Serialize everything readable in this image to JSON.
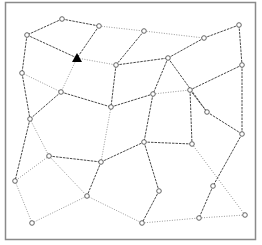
{
  "diagram": {
    "type": "graph",
    "frame": {
      "x": 5,
      "y": 2,
      "width": 250,
      "height": 237,
      "stroke": "#8a8a8a",
      "fill": "#ffffff"
    },
    "colors": {
      "dashed_edge": "#4a4a4a",
      "dotted_edge": "#9a9a9a",
      "node_fill": "#ffffff",
      "node_stroke": "#555555",
      "marker": "#000000"
    },
    "marker": {
      "type": "triangle",
      "x": 77,
      "y": 58
    },
    "nodes": [
      {
        "id": "n1",
        "x": 62,
        "y": 19
      },
      {
        "id": "n2",
        "x": 27,
        "y": 35
      },
      {
        "id": "n3",
        "x": 99,
        "y": 26
      },
      {
        "id": "n4",
        "x": 144,
        "y": 31
      },
      {
        "id": "n5",
        "x": 204,
        "y": 38
      },
      {
        "id": "n6",
        "x": 239,
        "y": 25
      },
      {
        "id": "n7",
        "x": 116,
        "y": 65
      },
      {
        "id": "n8",
        "x": 168,
        "y": 58
      },
      {
        "id": "n9",
        "x": 242,
        "y": 65
      },
      {
        "id": "n10",
        "x": 22,
        "y": 73
      },
      {
        "id": "n11",
        "x": 61,
        "y": 92
      },
      {
        "id": "n12",
        "x": 111,
        "y": 107
      },
      {
        "id": "n13",
        "x": 153,
        "y": 94
      },
      {
        "id": "n14",
        "x": 190,
        "y": 90
      },
      {
        "id": "n15",
        "x": 207,
        "y": 112
      },
      {
        "id": "n16",
        "x": 30,
        "y": 119
      },
      {
        "id": "n17",
        "x": 242,
        "y": 134
      },
      {
        "id": "n18",
        "x": 49,
        "y": 156
      },
      {
        "id": "n19",
        "x": 101,
        "y": 162
      },
      {
        "id": "n20",
        "x": 144,
        "y": 142
      },
      {
        "id": "n21",
        "x": 192,
        "y": 144
      },
      {
        "id": "n22",
        "x": 15,
        "y": 181
      },
      {
        "id": "n23",
        "x": 87,
        "y": 196
      },
      {
        "id": "n24",
        "x": 159,
        "y": 191
      },
      {
        "id": "n25",
        "x": 213,
        "y": 186
      },
      {
        "id": "n26",
        "x": 32,
        "y": 223
      },
      {
        "id": "n27",
        "x": 142,
        "y": 223
      },
      {
        "id": "n28",
        "x": 199,
        "y": 218
      },
      {
        "id": "n29",
        "x": 245,
        "y": 215
      }
    ],
    "edges": [
      {
        "from": [
          62,
          19
        ],
        "to": [
          27,
          35
        ],
        "style": "dashed"
      },
      {
        "from": [
          62,
          19
        ],
        "to": [
          99,
          26
        ],
        "style": "dashed"
      },
      {
        "from": [
          27,
          35
        ],
        "to": [
          77,
          58
        ],
        "style": "dashed"
      },
      {
        "from": [
          99,
          26
        ],
        "to": [
          77,
          58
        ],
        "style": "dashed"
      },
      {
        "from": [
          99,
          26
        ],
        "to": [
          144,
          31
        ],
        "style": "dotted"
      },
      {
        "from": [
          144,
          31
        ],
        "to": [
          204,
          38
        ],
        "style": "dotted"
      },
      {
        "from": [
          144,
          31
        ],
        "to": [
          116,
          65
        ],
        "style": "dashed"
      },
      {
        "from": [
          204,
          38
        ],
        "to": [
          239,
          25
        ],
        "style": "dashed"
      },
      {
        "from": [
          204,
          38
        ],
        "to": [
          168,
          58
        ],
        "style": "dashed"
      },
      {
        "from": [
          239,
          25
        ],
        "to": [
          242,
          65
        ],
        "style": "dashed"
      },
      {
        "from": [
          77,
          58
        ],
        "to": [
          116,
          65
        ],
        "style": "dotted"
      },
      {
        "from": [
          77,
          58
        ],
        "to": [
          61,
          92
        ],
        "style": "dotted"
      },
      {
        "from": [
          27,
          35
        ],
        "to": [
          22,
          73
        ],
        "style": "dashed"
      },
      {
        "from": [
          116,
          65
        ],
        "to": [
          168,
          58
        ],
        "style": "dashed"
      },
      {
        "from": [
          116,
          65
        ],
        "to": [
          111,
          107
        ],
        "style": "dashed"
      },
      {
        "from": [
          168,
          58
        ],
        "to": [
          153,
          94
        ],
        "style": "dashed"
      },
      {
        "from": [
          168,
          58
        ],
        "to": [
          207,
          112
        ],
        "style": "dashed"
      },
      {
        "from": [
          242,
          65
        ],
        "to": [
          190,
          90
        ],
        "style": "dashed"
      },
      {
        "from": [
          242,
          65
        ],
        "to": [
          242,
          134
        ],
        "style": "dashed"
      },
      {
        "from": [
          22,
          73
        ],
        "to": [
          61,
          92
        ],
        "style": "dotted"
      },
      {
        "from": [
          22,
          73
        ],
        "to": [
          30,
          119
        ],
        "style": "dashed"
      },
      {
        "from": [
          61,
          92
        ],
        "to": [
          111,
          107
        ],
        "style": "dashed"
      },
      {
        "from": [
          61,
          92
        ],
        "to": [
          30,
          119
        ],
        "style": "dashed"
      },
      {
        "from": [
          111,
          107
        ],
        "to": [
          153,
          94
        ],
        "style": "dashed"
      },
      {
        "from": [
          153,
          94
        ],
        "to": [
          190,
          90
        ],
        "style": "dotted"
      },
      {
        "from": [
          190,
          90
        ],
        "to": [
          207,
          112
        ],
        "style": "dashed"
      },
      {
        "from": [
          207,
          112
        ],
        "to": [
          242,
          134
        ],
        "style": "dashed"
      },
      {
        "from": [
          111,
          107
        ],
        "to": [
          101,
          162
        ],
        "style": "dotted"
      },
      {
        "from": [
          153,
          94
        ],
        "to": [
          144,
          142
        ],
        "style": "dashed"
      },
      {
        "from": [
          190,
          90
        ],
        "to": [
          192,
          144
        ],
        "style": "dashed"
      },
      {
        "from": [
          30,
          119
        ],
        "to": [
          49,
          156
        ],
        "style": "dotted"
      },
      {
        "from": [
          30,
          119
        ],
        "to": [
          15,
          181
        ],
        "style": "dashed"
      },
      {
        "from": [
          49,
          156
        ],
        "to": [
          101,
          162
        ],
        "style": "dashed"
      },
      {
        "from": [
          49,
          156
        ],
        "to": [
          15,
          181
        ],
        "style": "dotted"
      },
      {
        "from": [
          49,
          156
        ],
        "to": [
          87,
          196
        ],
        "style": "dotted"
      },
      {
        "from": [
          101,
          162
        ],
        "to": [
          144,
          142
        ],
        "style": "dashed"
      },
      {
        "from": [
          101,
          162
        ],
        "to": [
          87,
          196
        ],
        "style": "dashed"
      },
      {
        "from": [
          144,
          142
        ],
        "to": [
          192,
          144
        ],
        "style": "dashed"
      },
      {
        "from": [
          144,
          142
        ],
        "to": [
          159,
          191
        ],
        "style": "dashed"
      },
      {
        "from": [
          192,
          144
        ],
        "to": [
          245,
          215
        ],
        "style": "dotted"
      },
      {
        "from": [
          242,
          134
        ],
        "to": [
          213,
          186
        ],
        "style": "dashed"
      },
      {
        "from": [
          213,
          186
        ],
        "to": [
          199,
          218
        ],
        "style": "dashed"
      },
      {
        "from": [
          15,
          181
        ],
        "to": [
          32,
          223
        ],
        "style": "dotted"
      },
      {
        "from": [
          32,
          223
        ],
        "to": [
          87,
          196
        ],
        "style": "dotted"
      },
      {
        "from": [
          87,
          196
        ],
        "to": [
          142,
          223
        ],
        "style": "dotted"
      },
      {
        "from": [
          159,
          191
        ],
        "to": [
          142,
          223
        ],
        "style": "dashed"
      },
      {
        "from": [
          142,
          223
        ],
        "to": [
          199,
          218
        ],
        "style": "dotted"
      },
      {
        "from": [
          199,
          218
        ],
        "to": [
          245,
          215
        ],
        "style": "dotted"
      }
    ]
  }
}
